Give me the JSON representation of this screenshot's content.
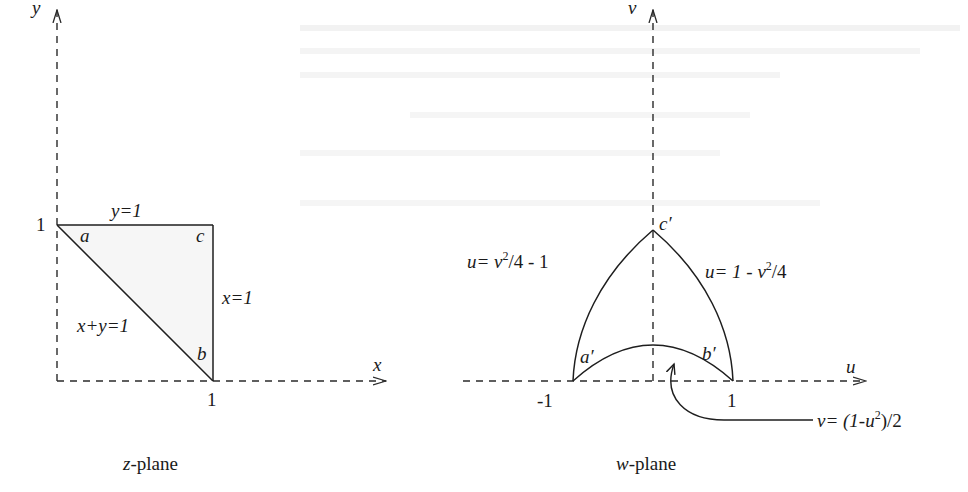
{
  "figure": {
    "z_plane": {
      "caption_var": "z",
      "caption_rest": "-plane",
      "axis_x_label": "x",
      "axis_y_label": "y",
      "tick_x_1": "1",
      "tick_y_1": "1",
      "edge_top_label": "y=1",
      "edge_right_label": "x=1",
      "edge_diag_label": "x+y=1",
      "vertex_a": "a",
      "vertex_b": "b",
      "vertex_c": "c"
    },
    "w_plane": {
      "caption_var": "w",
      "caption_rest": "-plane",
      "axis_u_label": "u",
      "axis_v_label": "v",
      "tick_u_neg1": "-1",
      "tick_u_1": "1",
      "left_curve_label_a": "u= v",
      "left_curve_label_sup": "2",
      "left_curve_label_b": "/4 - 1",
      "right_curve_label_a": "u= 1 - v",
      "right_curve_label_sup": "2",
      "right_curve_label_b": "/4",
      "bottom_curve_label_a": "v= (1-u",
      "bottom_curve_label_sup": "2",
      "bottom_curve_label_b": ")/2",
      "vertex_a": "a′",
      "vertex_b": "b′",
      "vertex_c": "c′"
    }
  }
}
